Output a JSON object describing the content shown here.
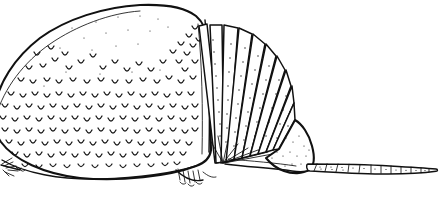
{
  "figure": {
    "title": "Armadillo carapace lateral view",
    "subject": "armadillo",
    "medium": "pen-and-ink line drawing",
    "orientation": "left-facing head, right-facing tail",
    "background_color": "#ffffff",
    "ink_color": "#111111",
    "width": 443,
    "height": 200
  },
  "parts": {
    "scapular_shield": {
      "label": "scapular shield",
      "texture": "u-shaped scale marks",
      "shading": "dense stipple toward lower and left margins"
    },
    "movable_bands": {
      "label": "movable bands",
      "count": 10,
      "arrangement": "fan radiating from ventral pivot",
      "shading": "stippled dots along trailing edge of each band"
    },
    "pelvic_shield": {
      "label": "pelvic shield",
      "shading": "light stipple"
    },
    "tail": {
      "label": "tail",
      "segment_count": 12,
      "form": "tapering segmented rings"
    },
    "fore_limb": {
      "label": "fore limb with claws"
    },
    "hind_limb": {
      "label": "hind limb with claws"
    },
    "ventral_outline": {
      "label": "ventral body outline"
    }
  }
}
